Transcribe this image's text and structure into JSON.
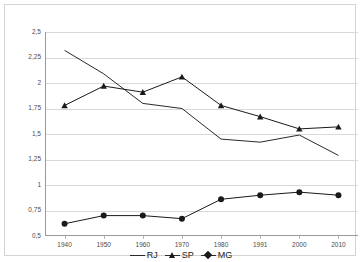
{
  "chart_data": {
    "type": "line",
    "title": "",
    "xlabel": "",
    "ylabel": "",
    "categories": [
      "1940",
      "1950",
      "1960",
      "1970",
      "1980",
      "1991",
      "2000",
      "2010"
    ],
    "ylim": [
      0.5,
      2.5
    ],
    "ytick_labels": [
      "2,5",
      "2,25",
      "2",
      "1,75",
      "1,5",
      "1,25",
      "1",
      "0,75",
      "0,5"
    ],
    "ytick_values": [
      2.5,
      2.25,
      2.0,
      1.75,
      1.5,
      1.25,
      1.0,
      0.75,
      0.5
    ],
    "grid": true,
    "legend_position": "bottom",
    "series": [
      {
        "name": "RJ",
        "marker": "none",
        "color": "#2a2a2a",
        "values": [
          2.32,
          2.09,
          1.8,
          1.75,
          1.45,
          1.42,
          1.49,
          1.29
        ]
      },
      {
        "name": "SP",
        "marker": "triangle",
        "color": "#1a1a1a",
        "values": [
          1.78,
          1.97,
          1.91,
          2.06,
          1.78,
          1.67,
          1.55,
          1.57
        ]
      },
      {
        "name": "MG",
        "marker": "diamond",
        "color": "#1a1a1a",
        "values": [
          0.62,
          0.7,
          0.7,
          0.67,
          0.86,
          0.9,
          0.93,
          0.9
        ]
      }
    ]
  },
  "legend": {
    "items": [
      {
        "label": "RJ",
        "swatch": "line-swatch"
      },
      {
        "label": "SP",
        "swatch": "triangle-swatch"
      },
      {
        "label": "MG",
        "swatch": "diamond-swatch"
      }
    ]
  }
}
